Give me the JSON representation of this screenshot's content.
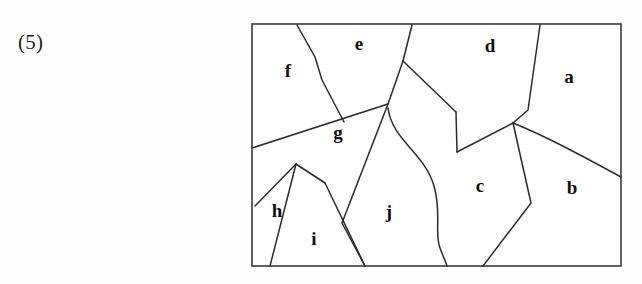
{
  "problem": {
    "number_label": "(5)"
  },
  "figure": {
    "name": "planar-map-regions",
    "frame": {
      "x": 252,
      "y": 24,
      "width": 369,
      "height": 242
    },
    "stroke_color": "#2b2b2b",
    "border_color": "#3a3a3a",
    "background_color": "#ffffff",
    "label_color": "#101010",
    "regions": [
      {
        "id": "a",
        "label": "a",
        "label_x": 569,
        "label_y": 79
      },
      {
        "id": "b",
        "label": "b",
        "label_x": 572,
        "label_y": 190
      },
      {
        "id": "c",
        "label": "c",
        "label_x": 480,
        "label_y": 188
      },
      {
        "id": "d",
        "label": "d",
        "label_x": 490,
        "label_y": 48
      },
      {
        "id": "e",
        "label": "e",
        "label_x": 359,
        "label_y": 46
      },
      {
        "id": "f",
        "label": "f",
        "label_x": 288,
        "label_y": 73
      },
      {
        "id": "g",
        "label": "g",
        "label_x": 338,
        "label_y": 135
      },
      {
        "id": "h",
        "label": "h",
        "label_x": 277,
        "label_y": 213
      },
      {
        "id": "i",
        "label": "i",
        "label_x": 314,
        "label_y": 241
      },
      {
        "id": "j",
        "label": "j",
        "label_x": 389,
        "label_y": 214
      }
    ],
    "edges": [
      {
        "id": "f-e",
        "from": "top-edge",
        "to": "g-apex-area",
        "path": "M 297 25 L 315 57 L 322 80 L 344 122"
      },
      {
        "id": "e-d-upper",
        "from": "top-edge",
        "to": "e-vertex",
        "path": "M 412 25 L 403 61"
      },
      {
        "id": "e-g-left",
        "from": "e-vertex",
        "to": "g-apex",
        "path": "M 403 61 L 388 104"
      },
      {
        "id": "e-d-lower",
        "from": "e-vertex",
        "to": "d-notch",
        "path": "M 403 61 L 456 112"
      },
      {
        "id": "d-notch-down",
        "from": "d-notch",
        "to": "d-notch-bottom",
        "path": "M 456 112 L 457 152"
      },
      {
        "id": "d-c-junction",
        "from": "d-notch-bottom",
        "to": "tri-junction",
        "path": "M 457 152 L 513 123"
      },
      {
        "id": "a-d",
        "from": "top-edge",
        "to": "tri-junction",
        "path": "M 540 25 L 528 110 L 513 123"
      },
      {
        "id": "b-c-upper",
        "from": "tri-junction",
        "to": "right-edge",
        "path": "M 513 123 C 545 136 575 152 621 177"
      },
      {
        "id": "c-b-lower",
        "from": "tri-junction",
        "to": "bottom-edge",
        "path": "M 513 123 L 531 203 L 483 266"
      },
      {
        "id": "g-long-diagonal",
        "from": "left-edge",
        "to": "g-apex",
        "path": "M 252 148 L 388 104"
      },
      {
        "id": "g-j-boundary",
        "from": "g-apex",
        "to": "bottom-edge",
        "path": "M 388 104 L 342 223 L 365 266"
      },
      {
        "id": "j-c-wavy",
        "from": "g-apex",
        "to": "bottom-edge",
        "path": "M 388 108 C 392 140 424 152 434 186 C 442 214 434 232 440 248 C 444 259 446 262 447 266"
      },
      {
        "id": "h-i-left",
        "from": "h-peak",
        "to": "bottom-edge",
        "path": "M 296 164 L 270 266"
      },
      {
        "id": "h-left-edge",
        "from": "h-peak",
        "to": "left-edge",
        "path": "M 296 164 L 255 206"
      },
      {
        "id": "h-i-top",
        "from": "h-peak",
        "to": "i-right-corner",
        "path": "M 296 164 L 325 183"
      },
      {
        "id": "i-right",
        "from": "i-right-corner",
        "to": "bottom-edge",
        "path": "M 325 183 L 365 266"
      }
    ]
  }
}
